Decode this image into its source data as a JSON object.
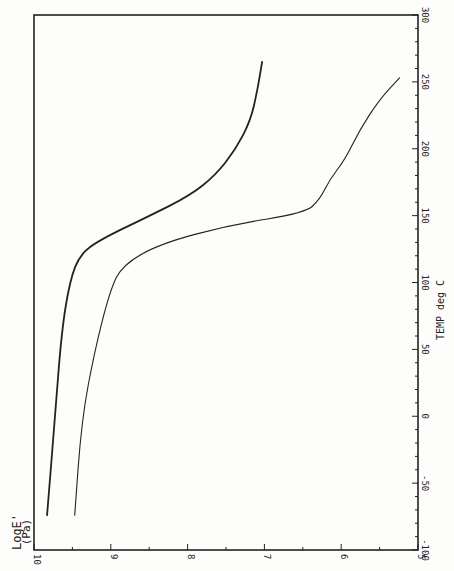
{
  "chart_data": {
    "type": "line",
    "orientation": "rotated-90-ccw",
    "title": "",
    "xlabel": "TEMP deg C",
    "ylabel": "LogE' (Pa)",
    "xlim": [
      -100,
      300
    ],
    "ylim": [
      5,
      10
    ],
    "x_ticks": [
      "-100",
      "-50",
      "0",
      "50",
      "100",
      "150",
      "200",
      "250",
      "300"
    ],
    "y_ticks": [
      "10",
      "9",
      "8",
      "7",
      "6",
      "5"
    ],
    "grid": false,
    "legend": null,
    "series": [
      {
        "name": "curve-1 (upper)",
        "style": "solid-bold",
        "x": [
          -74,
          -3,
          64,
          102,
          121,
          132,
          150,
          165,
          180,
          199,
          221,
          244,
          265
        ],
        "y": [
          9.83,
          9.73,
          9.64,
          9.53,
          9.4,
          9.14,
          8.49,
          7.97,
          7.64,
          7.38,
          7.18,
          7.09,
          7.03
        ]
      },
      {
        "name": "curve-2 (lower)",
        "style": "thin-dashed",
        "x": [
          -74,
          -3,
          49,
          94,
          113,
          129,
          143,
          152,
          162,
          177,
          192,
          214,
          237,
          253
        ],
        "y": [
          9.47,
          9.38,
          9.21,
          9.01,
          8.85,
          8.36,
          7.45,
          6.47,
          6.28,
          6.15,
          5.95,
          5.76,
          5.5,
          5.24
        ]
      }
    ]
  },
  "axes": {
    "temp_label": "TEMP deg C",
    "loge_label_line1": "LogE'",
    "loge_label_line2": "(Pa)"
  }
}
